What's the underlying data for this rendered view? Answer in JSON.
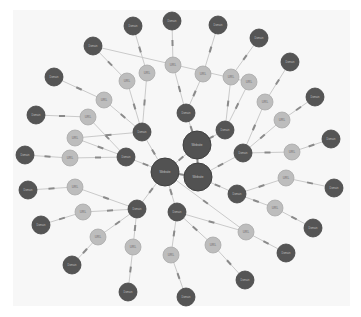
{
  "graph": {
    "background": "#f7f7f7",
    "colors": {
      "dark": "#555555",
      "light": "#bdbdbd",
      "edge": "#c4c4c4"
    },
    "big_nodes": [
      {
        "id": "B1",
        "x": 197,
        "y": 145,
        "r": 14,
        "label": "Website"
      },
      {
        "id": "B2",
        "x": 165,
        "y": 172,
        "r": 14,
        "label": "Website"
      },
      {
        "id": "B3",
        "x": 198,
        "y": 177,
        "r": 14,
        "label": "Website"
      }
    ],
    "mid_nodes": [
      {
        "id": "M1",
        "x": 186,
        "y": 113,
        "r": 9,
        "label": "Domain"
      },
      {
        "id": "M2",
        "x": 142,
        "y": 132,
        "r": 9,
        "label": "Domain"
      },
      {
        "id": "M3",
        "x": 225,
        "y": 130,
        "r": 9,
        "label": "Domain"
      },
      {
        "id": "M4",
        "x": 126,
        "y": 157,
        "r": 9,
        "label": "Domain"
      },
      {
        "id": "M5",
        "x": 243,
        "y": 153,
        "r": 9,
        "label": "Domain"
      },
      {
        "id": "M6",
        "x": 237,
        "y": 194,
        "r": 9,
        "label": "Domain"
      },
      {
        "id": "M7",
        "x": 137,
        "y": 209,
        "r": 9,
        "label": "Domain"
      },
      {
        "id": "M8",
        "x": 177,
        "y": 212,
        "r": 9,
        "label": "Domain"
      }
    ],
    "url_nodes": [
      {
        "id": "U1",
        "x": 147,
        "y": 73,
        "r": 8,
        "label": "URL"
      },
      {
        "id": "U2",
        "x": 173,
        "y": 65,
        "r": 8,
        "label": "URL"
      },
      {
        "id": "U3",
        "x": 203,
        "y": 74,
        "r": 8,
        "label": "URL"
      },
      {
        "id": "U4",
        "x": 231,
        "y": 77,
        "r": 8,
        "label": "URL"
      },
      {
        "id": "U5",
        "x": 127,
        "y": 81,
        "r": 8,
        "label": "URL"
      },
      {
        "id": "U6",
        "x": 249,
        "y": 82,
        "r": 8,
        "label": "URL"
      },
      {
        "id": "U7",
        "x": 104,
        "y": 100,
        "r": 8,
        "label": "URL"
      },
      {
        "id": "U8",
        "x": 265,
        "y": 102,
        "r": 8,
        "label": "URL"
      },
      {
        "id": "U9",
        "x": 88,
        "y": 117,
        "r": 8,
        "label": "URL"
      },
      {
        "id": "U10",
        "x": 282,
        "y": 120,
        "r": 8,
        "label": "URL"
      },
      {
        "id": "U11",
        "x": 75,
        "y": 138,
        "r": 8,
        "label": "URL"
      },
      {
        "id": "U12",
        "x": 292,
        "y": 152,
        "r": 8,
        "label": "URL"
      },
      {
        "id": "U13",
        "x": 70,
        "y": 158,
        "r": 8,
        "label": "URL"
      },
      {
        "id": "U14",
        "x": 286,
        "y": 178,
        "r": 8,
        "label": "URL"
      },
      {
        "id": "U15",
        "x": 75,
        "y": 187,
        "r": 8,
        "label": "URL"
      },
      {
        "id": "U16",
        "x": 275,
        "y": 208,
        "r": 8,
        "label": "URL"
      },
      {
        "id": "U17",
        "x": 83,
        "y": 212,
        "r": 8,
        "label": "URL"
      },
      {
        "id": "U18",
        "x": 246,
        "y": 232,
        "r": 8,
        "label": "URL"
      },
      {
        "id": "U19",
        "x": 98,
        "y": 237,
        "r": 8,
        "label": "URL"
      },
      {
        "id": "U20",
        "x": 213,
        "y": 245,
        "r": 8,
        "label": "URL"
      },
      {
        "id": "U21",
        "x": 133,
        "y": 247,
        "r": 8,
        "label": "URL"
      },
      {
        "id": "U22",
        "x": 171,
        "y": 255,
        "r": 8,
        "label": "URL"
      }
    ],
    "leaf_nodes": [
      {
        "id": "L1",
        "x": 133,
        "y": 26,
        "r": 9,
        "label": "Domain"
      },
      {
        "id": "L2",
        "x": 172,
        "y": 21,
        "r": 9,
        "label": "Domain"
      },
      {
        "id": "L3",
        "x": 218,
        "y": 25,
        "r": 9,
        "label": "Domain"
      },
      {
        "id": "L4",
        "x": 93,
        "y": 46,
        "r": 9,
        "label": "Domain"
      },
      {
        "id": "L5",
        "x": 259,
        "y": 38,
        "r": 9,
        "label": "Domain"
      },
      {
        "id": "L6",
        "x": 54,
        "y": 77,
        "r": 9,
        "label": "Domain"
      },
      {
        "id": "L7",
        "x": 290,
        "y": 62,
        "r": 9,
        "label": "Domain"
      },
      {
        "id": "L8",
        "x": 36,
        "y": 115,
        "r": 9,
        "label": "Domain"
      },
      {
        "id": "L9",
        "x": 315,
        "y": 97,
        "r": 9,
        "label": "Domain"
      },
      {
        "id": "L10",
        "x": 25,
        "y": 155,
        "r": 9,
        "label": "Domain"
      },
      {
        "id": "L11",
        "x": 331,
        "y": 139,
        "r": 9,
        "label": "Domain"
      },
      {
        "id": "L12",
        "x": 28,
        "y": 190,
        "r": 9,
        "label": "Domain"
      },
      {
        "id": "L13",
        "x": 334,
        "y": 188,
        "r": 9,
        "label": "Domain"
      },
      {
        "id": "L14",
        "x": 41,
        "y": 225,
        "r": 9,
        "label": "Domain"
      },
      {
        "id": "L15",
        "x": 313,
        "y": 228,
        "r": 9,
        "label": "Domain"
      },
      {
        "id": "L16",
        "x": 72,
        "y": 265,
        "r": 9,
        "label": "Domain"
      },
      {
        "id": "L17",
        "x": 286,
        "y": 253,
        "r": 9,
        "label": "Domain"
      },
      {
        "id": "L18",
        "x": 128,
        "y": 292,
        "r": 9,
        "label": "Domain"
      },
      {
        "id": "L19",
        "x": 245,
        "y": 280,
        "r": 9,
        "label": "Domain"
      },
      {
        "id": "L20",
        "x": 186,
        "y": 297,
        "r": 9,
        "label": "Domain"
      },
      {
        "id": "L21",
        "x": 126,
        "y": 155,
        "r": 0,
        "label": ""
      }
    ],
    "edges": [
      [
        "B1",
        "B2"
      ],
      [
        "B1",
        "B3"
      ],
      [
        "B2",
        "B3"
      ],
      [
        "M1",
        "B1"
      ],
      [
        "M3",
        "B1"
      ],
      [
        "M2",
        "B2"
      ],
      [
        "M4",
        "B2"
      ],
      [
        "M5",
        "B3"
      ],
      [
        "M6",
        "B3"
      ],
      [
        "M7",
        "B2"
      ],
      [
        "M8",
        "B2"
      ],
      [
        "U1",
        "M2"
      ],
      [
        "U2",
        "M1"
      ],
      [
        "U3",
        "M1"
      ],
      [
        "U4",
        "M3"
      ],
      [
        "U5",
        "M2"
      ],
      [
        "U6",
        "M3"
      ],
      [
        "U7",
        "M2"
      ],
      [
        "U8",
        "M5"
      ],
      [
        "U9",
        "M4"
      ],
      [
        "U10",
        "M5"
      ],
      [
        "U11",
        "M4"
      ],
      [
        "U12",
        "M5"
      ],
      [
        "U13",
        "M4"
      ],
      [
        "U14",
        "M6"
      ],
      [
        "U15",
        "M7"
      ],
      [
        "U16",
        "M6"
      ],
      [
        "U17",
        "M7"
      ],
      [
        "U18",
        "M8"
      ],
      [
        "U19",
        "M7"
      ],
      [
        "U20",
        "M8"
      ],
      [
        "U21",
        "M7"
      ],
      [
        "U22",
        "M8"
      ],
      [
        "L1",
        "U1"
      ],
      [
        "L2",
        "U2"
      ],
      [
        "L3",
        "U3"
      ],
      [
        "L4",
        "U5"
      ],
      [
        "L5",
        "U4"
      ],
      [
        "L6",
        "U7"
      ],
      [
        "L7",
        "U8"
      ],
      [
        "L8",
        "U9"
      ],
      [
        "L9",
        "U10"
      ],
      [
        "L10",
        "U13"
      ],
      [
        "L11",
        "U12"
      ],
      [
        "L12",
        "U15"
      ],
      [
        "L13",
        "U14"
      ],
      [
        "L14",
        "U17"
      ],
      [
        "L15",
        "U16"
      ],
      [
        "L16",
        "U19"
      ],
      [
        "L17",
        "U18"
      ],
      [
        "L18",
        "U21"
      ],
      [
        "L19",
        "U20"
      ],
      [
        "L20",
        "U22"
      ],
      [
        "L4",
        "U6"
      ],
      [
        "U11",
        "M2"
      ],
      [
        "B2",
        "U18"
      ]
    ]
  }
}
